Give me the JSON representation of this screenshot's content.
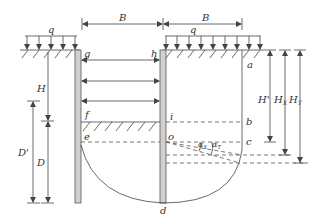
{
  "diagram": {
    "type": "braced excavation cross-section (basal heave stability)",
    "labels": {
      "load_left": "q",
      "load_right": "q",
      "width_left": "B",
      "width_right": "B",
      "point_g": "g",
      "point_h": "h",
      "point_a": "a",
      "point_f": "f",
      "point_e": "e",
      "point_i": "i",
      "point_b": "b",
      "point_o": "o",
      "point_c": "c",
      "point_d": "d",
      "depth_H": "H",
      "depth_D_prime": "D'",
      "depth_D": "D",
      "depth_H_prime": "H'",
      "depth_HX": "H",
      "depth_HX_sub": "X",
      "depth_HT": "H",
      "depth_HT_sub": "T",
      "angle_1": "α",
      "angle_1_sub": "X",
      "angle_2": "α",
      "angle_2_sub": "T"
    },
    "colors": {
      "line": "#444444",
      "wall_fill": "#d0d0d0",
      "background": "#ffffff"
    }
  }
}
